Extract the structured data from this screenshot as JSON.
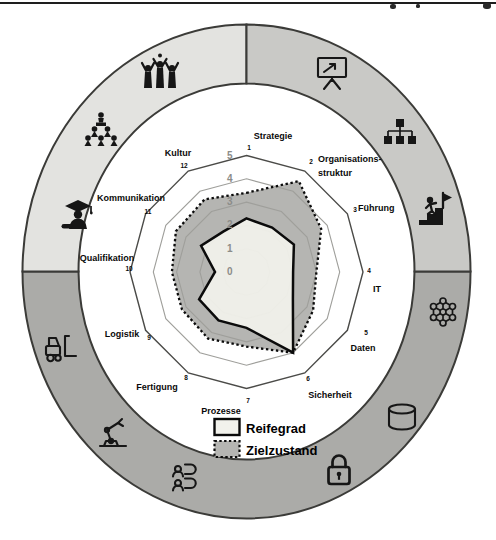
{
  "chart_data": {
    "type": "radar",
    "title": "",
    "axes": [
      "Strategie",
      "Organisations-struktur",
      "Führung",
      "IT",
      "Daten",
      "Sicherheit",
      "Prozesse",
      "Fertigung",
      "Logistik",
      "Qualifikation",
      "Kommunikation",
      "Kultur"
    ],
    "axis_numbers": [
      "1",
      "2",
      "3",
      "4",
      "5",
      "6",
      "7",
      "8",
      "9",
      "10",
      "11",
      "12"
    ],
    "rmin": 0,
    "rmax": 5,
    "ring_tick_labels": [
      "5",
      "4",
      "3",
      "2",
      "1",
      "0"
    ],
    "grid": "polygon-rings-0-to-5",
    "legend_position": "bottom-inside",
    "series": [
      {
        "name": "Reifegrad",
        "style": "solid",
        "values": [
          2.3,
          2.2,
          2.35,
          2.0,
          2.3,
          4.0,
          2.4,
          2.4,
          2.35,
          1.35,
          2.25,
          2.0
        ]
      },
      {
        "name": "Zielzustand",
        "style": "dotted",
        "values": [
          3.4,
          4.5,
          3.7,
          3.0,
          3.3,
          4.0,
          3.2,
          3.3,
          3.2,
          3.2,
          3.5,
          3.6
        ]
      }
    ]
  },
  "legend": {
    "items": [
      {
        "label": "Reifegrad",
        "swatch": "solid-black-border-light-fill"
      },
      {
        "label": "Zielzustand",
        "swatch": "dotted-black-border-gray-fill"
      }
    ]
  },
  "ring": {
    "segments": [
      {
        "position": "top-left",
        "shade": "#e3e3e0"
      },
      {
        "position": "top-right",
        "shade": "#c9c9c6"
      },
      {
        "position": "bottom",
        "shade": "#ababa8"
      }
    ],
    "icons": [
      {
        "name": "presentation-chart-icon",
        "represents": "Strategie"
      },
      {
        "name": "org-chart-icon",
        "represents": "Organisationsstruktur"
      },
      {
        "name": "career-climb-icon",
        "represents": "Führung"
      },
      {
        "name": "network-icon",
        "represents": "IT"
      },
      {
        "name": "database-icon",
        "represents": "Daten"
      },
      {
        "name": "lock-icon",
        "represents": "Sicherheit"
      },
      {
        "name": "dialogue-icon",
        "represents": "Prozesse"
      },
      {
        "name": "robot-arm-icon",
        "represents": "Fertigung"
      },
      {
        "name": "forklift-icon",
        "represents": "Logistik"
      },
      {
        "name": "graduate-icon",
        "represents": "Qualifikation"
      },
      {
        "name": "presenter-audience-icon",
        "represents": "Kommunikation"
      },
      {
        "name": "celebration-icon",
        "represents": "Kultur"
      }
    ]
  },
  "colors": {
    "reifegrad_fill": "#f2f2ec",
    "zielzustand_fill": "#b5b5b2",
    "series_stroke": "#0b0b0b",
    "grid_line": "#9f9f9b",
    "grid_outer": "#4b4b48",
    "ring_outline": "#3b3b38",
    "ring_top_left": "#e3e3e0",
    "ring_top_right": "#c9c9c6",
    "ring_bottom": "#ababa8",
    "tick_label": "#8c8c89"
  }
}
